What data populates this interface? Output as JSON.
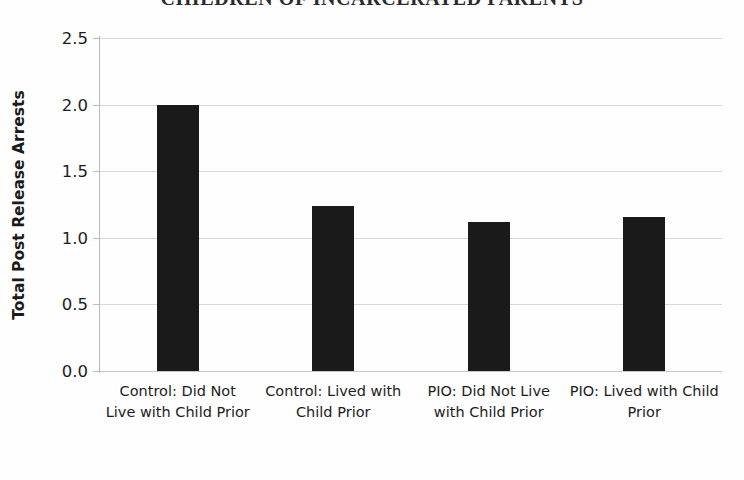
{
  "chart_data": {
    "type": "bar",
    "title": "CHILDREN OF INCARCERATED PARENTS",
    "xlabel": "",
    "ylabel": "Total Post Release Arrests",
    "categories": [
      "Control: Did Not Live with Child Prior",
      "Control: Lived with Child Prior",
      "PIO: Did Not Live with Child Prior",
      "PIO: Lived with Child Prior"
    ],
    "values": [
      2.0,
      1.24,
      1.12,
      1.16
    ],
    "ylim": [
      0.0,
      2.5
    ],
    "yticks": [
      "0.0",
      "0.5",
      "1.0",
      "1.5",
      "2.0",
      "2.5"
    ],
    "ytick_values": [
      0.0,
      0.5,
      1.0,
      1.5,
      2.0,
      2.5
    ],
    "grid": true,
    "legend": false,
    "bar_color": "#1a1a1a",
    "grid_color": "#d8d8d8",
    "background_color": "#fefefe"
  }
}
